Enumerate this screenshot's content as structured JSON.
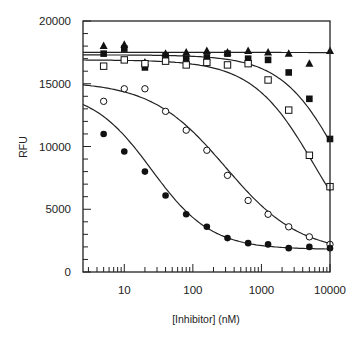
{
  "chart_data": {
    "type": "scatter",
    "title": "",
    "xlabel": "[Inhibitor] (nM)",
    "ylabel": "RFU",
    "xscale": "log",
    "xlim": [
      2.5,
      10000
    ],
    "ylim": [
      0,
      20000
    ],
    "x_ticks": [
      10,
      100,
      1000,
      10000
    ],
    "x_tick_labels": [
      "10",
      "100",
      "1000",
      "10000"
    ],
    "y_ticks": [
      0,
      5000,
      10000,
      15000,
      20000
    ],
    "y_tick_labels": [
      "0",
      "5000",
      "10000",
      "15000",
      "20000"
    ],
    "grid": false,
    "legend": "none",
    "x": [
      5,
      10,
      20,
      40,
      80,
      160,
      320,
      640,
      1250,
      2500,
      5000,
      10000
    ],
    "series": [
      {
        "name": "filled-triangle",
        "marker": "triangle-filled",
        "values": [
          18000,
          18100,
          16700,
          17400,
          17500,
          17600,
          17500,
          17600,
          17500,
          17400,
          16600,
          17600
        ],
        "fit": {
          "top": 17500,
          "bottom": 17200,
          "ic50": 100000
        }
      },
      {
        "name": "filled-square",
        "marker": "square-filled",
        "values": [
          17400,
          17800,
          16300,
          17200,
          17000,
          17100,
          17400,
          17000,
          16900,
          15900,
          13800,
          10600
        ],
        "fit": {
          "top": 17300,
          "bottom": 0,
          "ic50": 15000,
          "hill": 1.0
        }
      },
      {
        "name": "open-square",
        "marker": "square-open",
        "values": [
          16400,
          16900,
          16600,
          16800,
          16500,
          16700,
          16500,
          16600,
          15300,
          12900,
          9300,
          6800
        ],
        "fit": {
          "top": 16900,
          "bottom": 0,
          "ic50": 6000,
          "hill": 0.95
        }
      },
      {
        "name": "open-circle",
        "marker": "circle-open",
        "values": [
          13600,
          14600,
          14600,
          12800,
          11300,
          9700,
          7700,
          5700,
          4600,
          3600,
          2800,
          2200
        ],
        "fit": {
          "top": 15200,
          "bottom": 1500,
          "ic50": 300,
          "hill": 0.8
        }
      },
      {
        "name": "filled-circle",
        "marker": "circle-filled",
        "values": [
          11000,
          9600,
          8000,
          6100,
          4600,
          3600,
          2700,
          2300,
          2200,
          1900,
          2000,
          1900
        ],
        "fit": {
          "top": 14500,
          "bottom": 1800,
          "ic50": 25,
          "hill": 1.0
        }
      }
    ]
  }
}
